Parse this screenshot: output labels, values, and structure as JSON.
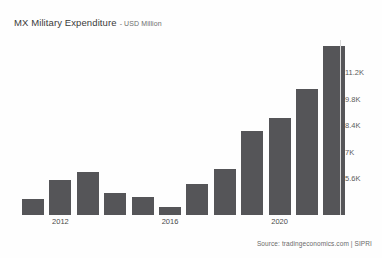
{
  "chart_data": {
    "type": "bar",
    "title": "MX Military Expenditure",
    "subtitle": "- USD Million",
    "xlabel": "",
    "ylabel": "",
    "grid": false,
    "legend": false,
    "bar_color": "#555558",
    "categories": [
      "2011",
      "2012",
      "2013",
      "2014",
      "2015",
      "2016",
      "2017",
      "2018",
      "2019",
      "2020",
      "2021",
      "2022"
    ],
    "visible_tick_labels": [
      "2012",
      "2016",
      "2020"
    ],
    "values": [
      4500,
      5500,
      5900,
      4800,
      4600,
      4050,
      5300,
      6100,
      8100,
      8800,
      10300,
      12600
    ],
    "ylim": [
      3650,
      12900
    ],
    "y_ticks": [
      5600,
      7000,
      8400,
      9800,
      11200
    ],
    "y_tick_labels": [
      "5.6K",
      "7K",
      "8.4K",
      "9.8K",
      "11.2K"
    ]
  },
  "source": {
    "text": "Source: tradingeconomics.com | SIPRI"
  }
}
